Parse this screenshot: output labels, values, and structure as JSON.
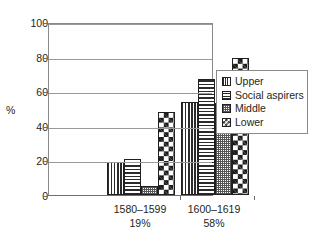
{
  "chart_data": {
    "type": "bar",
    "title": "",
    "subtitle": "",
    "xlabel": "",
    "ylabel": "%",
    "ylim": [
      0,
      100
    ],
    "yticks": [
      0,
      20,
      40,
      60,
      80,
      100
    ],
    "ytick_labels": [
      "0",
      "20",
      "40",
      "60",
      "80",
      "100"
    ],
    "grid": true,
    "legend_position": "right",
    "categories": [
      "1580–1599",
      "1600–1619"
    ],
    "category_sublabels": [
      "19%",
      "58%"
    ],
    "series": [
      {
        "name": "Upper",
        "pattern": "vertical-stripes",
        "values": [
          19,
          54
        ]
      },
      {
        "name": "Social aspirers",
        "pattern": "horizontal-stripes",
        "values": [
          21,
          67
        ]
      },
      {
        "name": "Middle",
        "pattern": "stipple-dots",
        "values": [
          5,
          53
        ]
      },
      {
        "name": "Lower",
        "pattern": "checkerboard",
        "values": [
          48,
          79
        ]
      }
    ]
  },
  "colors": {
    "ink": "#231f20",
    "axis": "#8a8a8a",
    "grid": "#9a9a9a",
    "background": "#ffffff"
  }
}
